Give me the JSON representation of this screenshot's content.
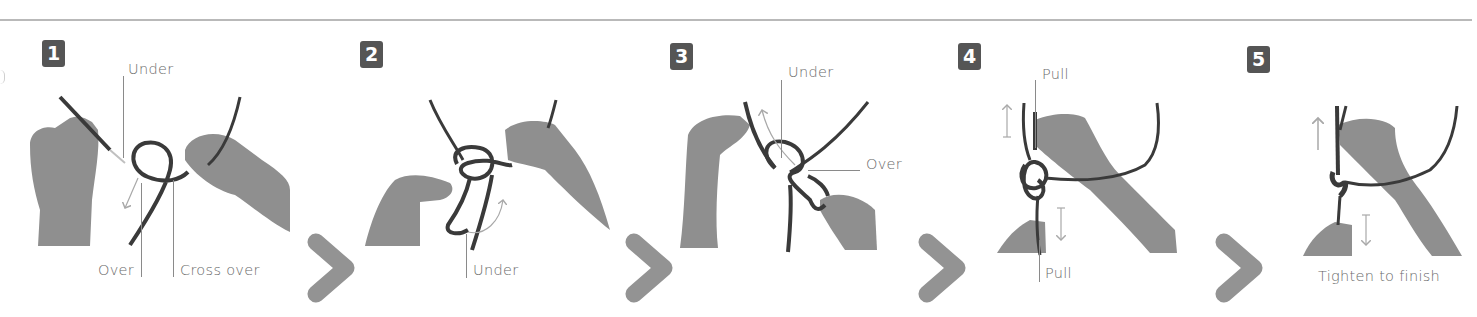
{
  "diagram": {
    "colors": {
      "badge_bg": "#555555",
      "badge_text": "#ffffff",
      "label_text": "#6a6a6a",
      "leader_line": "#8a8a8a",
      "chevron": "#939393",
      "rope": "#3a3a3a",
      "hand": "#8f8f8f",
      "motion_arrow": "#a8a8a8",
      "top_rule": "#b9b9b9"
    },
    "steps": [
      {
        "number": "1",
        "labels": {
          "under": "Under",
          "over": "Over",
          "cross_over": "Cross over"
        }
      },
      {
        "number": "2",
        "labels": {
          "under": "Under"
        }
      },
      {
        "number": "3",
        "labels": {
          "under": "Under",
          "over": "Over"
        }
      },
      {
        "number": "4",
        "labels": {
          "pull_top": "Pull",
          "pull_bottom": "Pull"
        }
      },
      {
        "number": "5",
        "labels": {
          "caption": "Tighten to finish"
        }
      }
    ],
    "separators": [
      {
        "icon": "chevron-right-icon"
      },
      {
        "icon": "chevron-right-icon"
      },
      {
        "icon": "chevron-right-icon"
      },
      {
        "icon": "chevron-right-icon"
      }
    ]
  }
}
